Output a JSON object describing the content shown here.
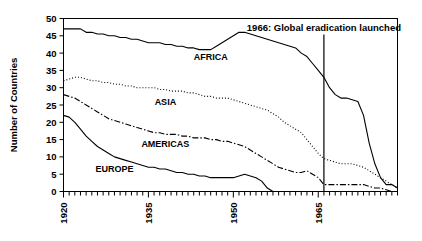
{
  "chart_data": {
    "type": "line",
    "title": "",
    "xlabel": "",
    "ylabel": "Number of Countries",
    "xlim": [
      1920,
      1979
    ],
    "ylim": [
      0,
      50
    ],
    "ytick_values": [
      0,
      5,
      10,
      15,
      20,
      25,
      30,
      35,
      40,
      45,
      50
    ],
    "ytick_labels": [
      "0",
      "5",
      "10",
      "15",
      "20",
      "25",
      "30",
      "35",
      "40",
      "45",
      "50"
    ],
    "xtick_labels": [
      "1920",
      "1935",
      "1950",
      "1965"
    ],
    "xtick_values": [
      1920,
      1935,
      1950,
      1965
    ],
    "minor_xticks_every": 1,
    "grid": false,
    "legend": "inline-labels",
    "annotations": [
      {
        "name": "eradication-marker",
        "text": "1966: Global eradication launched",
        "x": 1966,
        "style": "vertical-line"
      }
    ],
    "series": [
      {
        "name": "AFRICA",
        "style": "solid",
        "color": "#000000",
        "label_x": 1946,
        "label_y": 38,
        "x": [
          1920,
          1921,
          1922,
          1923,
          1924,
          1925,
          1926,
          1927,
          1928,
          1929,
          1930,
          1931,
          1932,
          1933,
          1934,
          1935,
          1936,
          1937,
          1938,
          1939,
          1940,
          1941,
          1942,
          1943,
          1944,
          1945,
          1946,
          1947,
          1948,
          1949,
          1950,
          1951,
          1952,
          1953,
          1954,
          1955,
          1956,
          1957,
          1958,
          1959,
          1960,
          1961,
          1962,
          1963,
          1964,
          1965,
          1966,
          1967,
          1968,
          1969,
          1970,
          1971,
          1972,
          1973,
          1974,
          1975,
          1976,
          1977,
          1978,
          1979
        ],
        "values": [
          47,
          47,
          47,
          47,
          46,
          46,
          45.5,
          45.5,
          45,
          45,
          44.5,
          44.5,
          44,
          44,
          43.5,
          43,
          43,
          43,
          42.5,
          42.5,
          42,
          42,
          41.5,
          41.5,
          41,
          41,
          41,
          42,
          43,
          44,
          45,
          46,
          46,
          45.5,
          45,
          44.5,
          44,
          43.5,
          43,
          42.5,
          42,
          41.5,
          40,
          39,
          37,
          35,
          33,
          30,
          28,
          27,
          27,
          26.5,
          26,
          22,
          14,
          8,
          4,
          2,
          2,
          1
        ]
      },
      {
        "name": "ASIA",
        "style": "dotted",
        "color": "#000000",
        "label_x": 1938,
        "label_y": 25,
        "x": [
          1920,
          1921,
          1922,
          1923,
          1924,
          1925,
          1926,
          1927,
          1928,
          1929,
          1930,
          1931,
          1932,
          1933,
          1934,
          1935,
          1936,
          1937,
          1938,
          1939,
          1940,
          1941,
          1942,
          1943,
          1944,
          1945,
          1946,
          1947,
          1948,
          1949,
          1950,
          1951,
          1952,
          1953,
          1954,
          1955,
          1956,
          1957,
          1958,
          1959,
          1960,
          1961,
          1962,
          1963,
          1964,
          1965,
          1966,
          1967,
          1968,
          1969,
          1970,
          1971,
          1972,
          1973,
          1974,
          1975,
          1976,
          1977,
          1978,
          1979
        ],
        "values": [
          32,
          32.5,
          33,
          33,
          32.5,
          32,
          32,
          31.5,
          31.5,
          31,
          31,
          30.5,
          30.5,
          30,
          30,
          30,
          30,
          29.5,
          29.5,
          29,
          29,
          29,
          28.5,
          28.5,
          28,
          27.5,
          27.5,
          27,
          27,
          27,
          26.5,
          26,
          25.5,
          25,
          24.5,
          24,
          23.5,
          22.5,
          21.5,
          20,
          19,
          18,
          17,
          15,
          13,
          11,
          9.5,
          9,
          8.5,
          8,
          8,
          8,
          7.5,
          7,
          6,
          5,
          4,
          3,
          2,
          1
        ]
      },
      {
        "name": "AMERICAS",
        "style": "dashdot",
        "color": "#000000",
        "label_x": 1938,
        "label_y": 13,
        "x": [
          1920,
          1921,
          1922,
          1923,
          1924,
          1925,
          1926,
          1927,
          1928,
          1929,
          1930,
          1931,
          1932,
          1933,
          1934,
          1935,
          1936,
          1937,
          1938,
          1939,
          1940,
          1941,
          1942,
          1943,
          1944,
          1945,
          1946,
          1947,
          1948,
          1949,
          1950,
          1951,
          1952,
          1953,
          1954,
          1955,
          1956,
          1957,
          1958,
          1959,
          1960,
          1961,
          1962,
          1963,
          1964,
          1965,
          1966,
          1967,
          1968,
          1969,
          1970,
          1971,
          1972,
          1973,
          1974,
          1975,
          1976,
          1977,
          1978,
          1979
        ],
        "values": [
          28,
          27.5,
          27,
          26,
          25,
          24,
          23,
          22,
          21,
          20.5,
          20,
          19.5,
          19,
          18.5,
          18,
          17.5,
          17,
          17,
          16.5,
          16.5,
          16.5,
          16,
          16,
          15.5,
          15.5,
          15.5,
          15,
          15,
          14.5,
          14.5,
          14,
          13.5,
          13,
          12,
          11,
          10,
          9,
          8,
          7,
          6.5,
          6,
          5.5,
          5.5,
          6,
          5,
          4,
          2,
          2,
          2,
          2,
          2,
          2,
          2,
          2,
          1.5,
          1,
          1,
          0.5,
          0,
          0
        ]
      },
      {
        "name": "EUROPE",
        "style": "solid",
        "color": "#000000",
        "label_x": 1929,
        "label_y": 5.5,
        "x": [
          1920,
          1921,
          1922,
          1923,
          1924,
          1925,
          1926,
          1927,
          1928,
          1929,
          1930,
          1931,
          1932,
          1933,
          1934,
          1935,
          1936,
          1937,
          1938,
          1939,
          1940,
          1941,
          1942,
          1943,
          1944,
          1945,
          1946,
          1947,
          1948,
          1949,
          1950,
          1951,
          1952,
          1953,
          1954,
          1955,
          1956,
          1957,
          1958,
          1959,
          1960,
          1961,
          1962,
          1963,
          1964,
          1965,
          1966,
          1967,
          1968,
          1969,
          1970,
          1971,
          1972,
          1973,
          1974,
          1975,
          1976,
          1977,
          1978,
          1979
        ],
        "values": [
          22,
          21.5,
          20,
          18,
          16,
          14.5,
          13,
          12,
          11,
          10,
          9.5,
          9,
          8.5,
          8,
          7.5,
          7,
          7,
          6.5,
          6.5,
          6,
          5.5,
          5.5,
          5,
          5,
          4.5,
          4.5,
          4,
          4,
          4,
          4,
          4,
          4.5,
          5,
          4.5,
          4,
          3,
          1,
          0,
          0,
          0,
          0,
          0,
          0,
          0,
          0,
          0,
          0,
          0,
          0,
          0,
          0,
          0,
          0,
          0,
          0,
          0,
          0,
          0,
          0,
          0
        ]
      }
    ]
  },
  "axis": {
    "ylabel": "Number of Countries"
  }
}
